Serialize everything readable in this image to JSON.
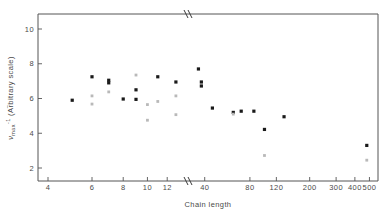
{
  "chart_data": {
    "type": "scatter",
    "title": "",
    "xlabel": "Chain length",
    "ylabel": "v~max -1 (Arbitrary scale)",
    "ylabel_parts": {
      "symbol": "ν",
      "subscript": "max",
      "superscript": "-1",
      "suffix": "(Arbitrary scale)"
    },
    "x_scale": "log-with-break",
    "x_ticks": [
      4,
      6,
      8,
      10,
      12,
      40,
      80,
      120,
      200,
      300,
      400,
      500
    ],
    "x_tick_labels": [
      "4",
      "6",
      "8",
      "10",
      "12",
      "40",
      "80",
      "120",
      "200",
      "300",
      "400",
      "500"
    ],
    "y_ticks": [
      2,
      4,
      6,
      8,
      10
    ],
    "y_tick_labels": [
      "2",
      "4",
      "6",
      "8",
      "10"
    ],
    "ylim": [
      0.6,
      11.3
    ],
    "axis_break_x": 160,
    "axis_break_note": "// break on both top and bottom x axes between 12 and 40",
    "grid": false,
    "legend": null,
    "series": [
      {
        "name": "filled",
        "marker": "filled-square",
        "color": "#1a1a1a",
        "points": [
          {
            "x": 5,
            "y": 5.9
          },
          {
            "x": 6,
            "y": 7.25
          },
          {
            "x": 7,
            "y": 7.05
          },
          {
            "x": 7,
            "y": 6.9
          },
          {
            "x": 8,
            "y": 5.97
          },
          {
            "x": 9,
            "y": 6.5
          },
          {
            "x": 9,
            "y": 5.95
          },
          {
            "x": 11,
            "y": 7.25
          },
          {
            "x": 13,
            "y": 6.95
          },
          {
            "x": 16,
            "y": 7.7
          },
          {
            "x": 38,
            "y": 6.95
          },
          {
            "x": 38,
            "y": 6.72
          },
          {
            "x": 45,
            "y": 5.45
          },
          {
            "x": 62,
            "y": 5.2
          },
          {
            "x": 70,
            "y": 5.27
          },
          {
            "x": 85,
            "y": 5.27
          },
          {
            "x": 100,
            "y": 4.22
          },
          {
            "x": 135,
            "y": 4.95
          },
          {
            "x": 480,
            "y": 3.3
          }
        ]
      },
      {
        "name": "open",
        "marker": "open-square",
        "color": "#b9b9b9",
        "points": [
          {
            "x": 6,
            "y": 6.15
          },
          {
            "x": 6,
            "y": 5.68
          },
          {
            "x": 7,
            "y": 6.38
          },
          {
            "x": 9,
            "y": 7.35
          },
          {
            "x": 10,
            "y": 5.65
          },
          {
            "x": 10,
            "y": 4.75
          },
          {
            "x": 11,
            "y": 5.83
          },
          {
            "x": 13,
            "y": 6.15
          },
          {
            "x": 13,
            "y": 5.07
          },
          {
            "x": 62,
            "y": 5.1
          },
          {
            "x": 100,
            "y": 2.72
          },
          {
            "x": 480,
            "y": 2.45
          }
        ]
      }
    ]
  },
  "figure": {
    "background": "#ffffff",
    "axis_color": "#555555",
    "text_color": "#4a4a4a"
  }
}
